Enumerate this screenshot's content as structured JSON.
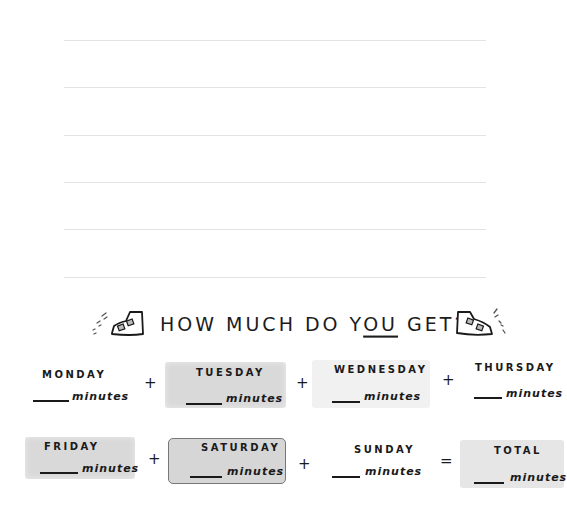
{
  "ruled_lines": {
    "count": 6,
    "y_positions": [
      40,
      87,
      135,
      182,
      229,
      277
    ],
    "color": "#e3e3e3"
  },
  "heading": {
    "part1": "HOW MUCH DO Y",
    "part2_underlined": "OU",
    "part3": " GET?",
    "left_icon": "sneaker-icon",
    "right_icon": "sneaker-icon"
  },
  "days": [
    {
      "label": "MONDAY",
      "unit": "minutes",
      "style": "plain"
    },
    {
      "label": "TUESDAY",
      "unit": "minutes",
      "style": "gray"
    },
    {
      "label": "WEDNESDAY",
      "unit": "minutes",
      "style": "light"
    },
    {
      "label": "THURSDAY",
      "unit": "minutes",
      "style": "plain"
    },
    {
      "label": "FRIDAY",
      "unit": "minutes",
      "style": "gray"
    },
    {
      "label": "SATURDAY",
      "unit": "minutes",
      "style": "outlined"
    },
    {
      "label": "SUNDAY",
      "unit": "minutes",
      "style": "plain"
    }
  ],
  "total": {
    "label": "TOTAL",
    "unit": "minutes"
  },
  "operators": {
    "plus": "+",
    "equals": "="
  },
  "colors": {
    "ink": "#1a1a1a",
    "box_gray": "#d9d9d9",
    "box_light": "#f1f1f1",
    "box_total": "#e6e6e6"
  }
}
